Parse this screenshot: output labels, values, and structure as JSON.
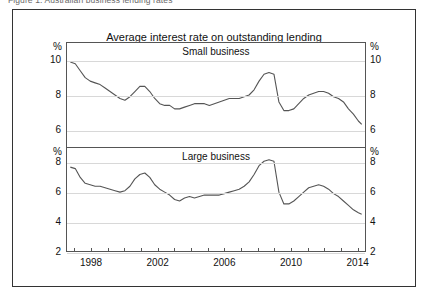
{
  "figure": {
    "caption": "Figure 1: Australian business lending rates"
  },
  "chart_data": {
    "type": "line",
    "title": "Average interest rate on outstanding lending",
    "xlabel": "",
    "ylabel": "%",
    "xlim": [
      1996.5,
      2014.5
    ],
    "grid": true,
    "legend": "none",
    "xticks": [
      1998,
      2002,
      2006,
      2010,
      2014
    ],
    "xtick_labels": [
      "1998",
      "2002",
      "2006",
      "2010",
      "2014"
    ],
    "minor_xtick_interval": 1,
    "panels": [
      {
        "name": "small-business",
        "label": "Small business",
        "unit": "%",
        "ylim": [
          5,
          11
        ],
        "yticks": [
          10,
          8,
          6
        ],
        "ytick_labels": [
          "10",
          "8",
          "6"
        ],
        "series": [
          {
            "name": "Small business average interest rate on outstanding lending",
            "color": "#555555",
            "x": [
              1996.7,
              1997.0,
              1997.3,
              1997.6,
              1997.9,
              1998.2,
              1998.5,
              1998.8,
              1999.1,
              1999.4,
              1999.7,
              2000.0,
              2000.3,
              2000.6,
              2000.9,
              2001.2,
              2001.5,
              2001.8,
              2002.1,
              2002.4,
              2002.7,
              2003.0,
              2003.3,
              2003.6,
              2003.9,
              2004.2,
              2004.5,
              2004.8,
              2005.1,
              2005.4,
              2005.7,
              2006.0,
              2006.3,
              2006.6,
              2006.9,
              2007.2,
              2007.5,
              2007.8,
              2008.1,
              2008.4,
              2008.7,
              2009.0,
              2009.3,
              2009.6,
              2009.9,
              2010.2,
              2010.5,
              2010.8,
              2011.1,
              2011.4,
              2011.7,
              2012.0,
              2012.3,
              2012.6,
              2012.9,
              2013.2,
              2013.5,
              2013.8,
              2014.1,
              2014.3
            ],
            "y": [
              9.9,
              9.8,
              9.4,
              9.0,
              8.8,
              8.7,
              8.6,
              8.4,
              8.2,
              8.0,
              7.8,
              7.7,
              7.9,
              8.2,
              8.5,
              8.5,
              8.2,
              7.8,
              7.5,
              7.4,
              7.4,
              7.2,
              7.2,
              7.3,
              7.4,
              7.5,
              7.5,
              7.5,
              7.4,
              7.5,
              7.6,
              7.7,
              7.8,
              7.8,
              7.8,
              7.9,
              8.0,
              8.3,
              8.8,
              9.2,
              9.3,
              9.2,
              7.6,
              7.1,
              7.1,
              7.2,
              7.5,
              7.8,
              8.0,
              8.1,
              8.2,
              8.2,
              8.1,
              7.9,
              7.8,
              7.6,
              7.2,
              6.9,
              6.5,
              6.3
            ]
          }
        ]
      },
      {
        "name": "large-business",
        "label": "Large business",
        "unit": "%",
        "ylim": [
          2,
          9
        ],
        "yticks": [
          8,
          6,
          4,
          2
        ],
        "ytick_labels": [
          "8",
          "6",
          "4",
          "2"
        ],
        "series": [
          {
            "name": "Large business average interest rate on outstanding lending",
            "color": "#555555",
            "x": [
              1996.7,
              1997.0,
              1997.3,
              1997.6,
              1997.9,
              1998.2,
              1998.5,
              1998.8,
              1999.1,
              1999.4,
              1999.7,
              2000.0,
              2000.3,
              2000.6,
              2000.9,
              2001.2,
              2001.5,
              2001.8,
              2002.1,
              2002.4,
              2002.7,
              2003.0,
              2003.3,
              2003.6,
              2003.9,
              2004.2,
              2004.5,
              2004.8,
              2005.1,
              2005.4,
              2005.7,
              2006.0,
              2006.3,
              2006.6,
              2006.9,
              2007.2,
              2007.5,
              2007.8,
              2008.1,
              2008.4,
              2008.7,
              2009.0,
              2009.3,
              2009.6,
              2009.9,
              2010.2,
              2010.5,
              2010.8,
              2011.1,
              2011.4,
              2011.7,
              2012.0,
              2012.3,
              2012.6,
              2012.9,
              2013.2,
              2013.5,
              2013.8,
              2014.1,
              2014.3
            ],
            "y": [
              7.7,
              7.6,
              7.0,
              6.6,
              6.5,
              6.4,
              6.4,
              6.3,
              6.2,
              6.1,
              6.0,
              6.1,
              6.4,
              6.9,
              7.2,
              7.3,
              7.0,
              6.5,
              6.2,
              6.0,
              5.8,
              5.5,
              5.4,
              5.6,
              5.7,
              5.6,
              5.7,
              5.8,
              5.8,
              5.8,
              5.8,
              5.9,
              6.0,
              6.1,
              6.2,
              6.4,
              6.7,
              7.2,
              7.8,
              8.1,
              8.2,
              8.1,
              6.0,
              5.2,
              5.2,
              5.4,
              5.7,
              6.0,
              6.3,
              6.4,
              6.5,
              6.4,
              6.2,
              5.9,
              5.7,
              5.4,
              5.1,
              4.8,
              4.6,
              4.5
            ]
          }
        ]
      }
    ]
  }
}
